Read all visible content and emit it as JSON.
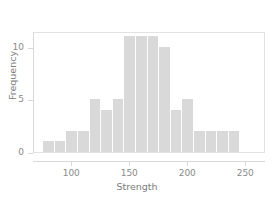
{
  "chart_data": {
    "type": "bar",
    "chart_subtype": "histogram",
    "title": "",
    "xlabel": "Strength",
    "ylabel": "Frequency",
    "xlim": [
      67,
      267
    ],
    "ylim": [
      0,
      11.5
    ],
    "grid": false,
    "legend": null,
    "bin_width": 10,
    "bin_edges": [
      75,
      85,
      95,
      105,
      115,
      125,
      135,
      145,
      155,
      165,
      175,
      185,
      195,
      205,
      215,
      225,
      235,
      245
    ],
    "categories": [
      "75-85",
      "85-95",
      "95-105",
      "105-115",
      "115-125",
      "125-135",
      "135-145",
      "145-155",
      "155-165",
      "165-175",
      "175-185",
      "185-195",
      "195-205",
      "205-215",
      "215-225",
      "225-235",
      "235-245"
    ],
    "values": [
      1,
      1,
      2,
      2,
      5,
      4,
      5,
      11,
      11,
      11,
      10,
      4,
      5,
      2,
      2,
      2,
      2
    ],
    "x_ticks": [
      100,
      150,
      200,
      250
    ],
    "x_tick_labels": [
      "100",
      "150",
      "200",
      "250"
    ],
    "y_ticks": [
      0,
      5,
      10
    ],
    "y_tick_labels": [
      "0",
      "5",
      "10"
    ],
    "bar_color": "#d9d9d9",
    "axis_color": "#d8d8d8",
    "tick_label_color": "#8a8a8a",
    "axis_title_color": "#7d7d7d",
    "background_color": "#ffffff"
  }
}
